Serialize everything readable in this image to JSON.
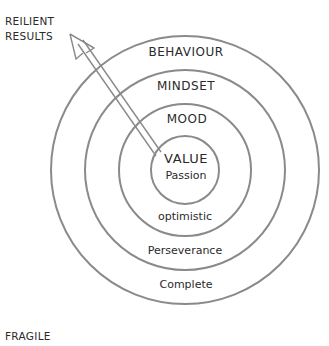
{
  "diagram": {
    "top_left_label_line1": "REILIENT",
    "top_left_label_line2": "RESULTS",
    "bottom_left_label": "FRAGILE",
    "rings": [
      {
        "name": "value",
        "top_label": "VALUE",
        "bottom_label": "Passion"
      },
      {
        "name": "mood",
        "top_label": "MOOD",
        "bottom_label": "optimistic"
      },
      {
        "name": "mindset",
        "top_label": "MINDSET",
        "bottom_label": "Perseverance"
      },
      {
        "name": "behaviour",
        "top_label": "BEHAVIOUR",
        "bottom_label": "Complete"
      }
    ],
    "arrow": {
      "from": "VALUE",
      "to": "REILIENT RESULTS"
    },
    "colors": {
      "line": "#8a8a8a",
      "text": "#2a2a2a",
      "background": "#ffffff"
    }
  }
}
